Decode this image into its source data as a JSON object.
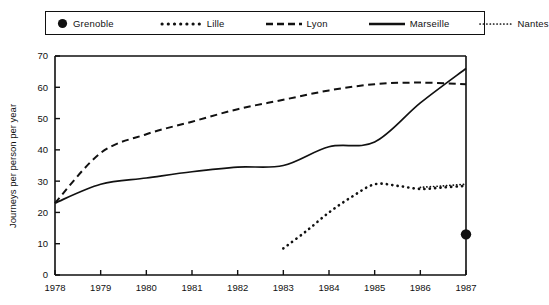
{
  "legend": {
    "entries": [
      {
        "label": "Grenoble",
        "style": "point",
        "icon": "filled-circle-marker-icon"
      },
      {
        "label": "Lille",
        "style": "thick-dotted",
        "icon": "thick-dotted-line-icon"
      },
      {
        "label": "Lyon",
        "style": "dashed",
        "icon": "dashed-line-icon"
      },
      {
        "label": "Marseille",
        "style": "solid",
        "icon": "solid-line-icon"
      },
      {
        "label": "Nantes",
        "style": "fine-dotted",
        "icon": "fine-dotted-line-icon"
      }
    ]
  },
  "chart_data": {
    "type": "line",
    "title": "",
    "xlabel": "",
    "ylabel": "Journeys per person per year",
    "x": [
      1978,
      1979,
      1980,
      1981,
      1982,
      1983,
      1984,
      1985,
      1986,
      1987
    ],
    "xtick_labels": [
      "1978",
      "1979",
      "1980",
      "1981",
      "1982",
      "1983",
      "1984",
      "1985",
      "1986",
      "1987"
    ],
    "ytick_labels": [
      "0",
      "10",
      "20",
      "30",
      "40",
      "50",
      "60",
      "70"
    ],
    "yticks": [
      0,
      10,
      20,
      30,
      40,
      50,
      60,
      70
    ],
    "xlim": [
      1978,
      1987
    ],
    "ylim": [
      0,
      70
    ],
    "grid": false,
    "legend_position": "above-plot",
    "series": [
      {
        "name": "Grenoble",
        "style": "point",
        "x": [
          1987
        ],
        "values": [
          13
        ]
      },
      {
        "name": "Lille",
        "style": "thick-dotted",
        "x": [
          1983,
          1983.5,
          1984,
          1984.5,
          1985,
          1985.5,
          1986,
          1986.5,
          1987
        ],
        "values": [
          8.5,
          14,
          20,
          25,
          29,
          28.5,
          27.5,
          28,
          28.5
        ]
      },
      {
        "name": "Lyon",
        "style": "dashed",
        "x": [
          1978,
          1979,
          1980,
          1981,
          1982,
          1983,
          1984,
          1985,
          1986,
          1987
        ],
        "values": [
          23,
          39,
          45,
          49,
          53,
          56,
          59,
          61,
          61.5,
          61
        ]
      },
      {
        "name": "Marseille",
        "style": "solid",
        "x": [
          1978,
          1979,
          1980,
          1981,
          1982,
          1983,
          1984,
          1985,
          1986,
          1987
        ],
        "values": [
          23,
          29,
          31,
          33,
          34.5,
          35,
          41,
          42.5,
          55,
          66
        ]
      },
      {
        "name": "Nantes",
        "style": "fine-dotted",
        "x": [
          1986,
          1986.5,
          1987
        ],
        "values": [
          28,
          28.5,
          29
        ]
      }
    ]
  },
  "colors": {
    "ink": "#111111",
    "background": "#ffffff"
  }
}
